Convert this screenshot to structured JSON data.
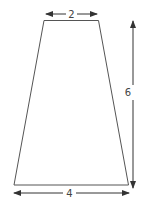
{
  "diagram": {
    "shape": "trapezoid",
    "colors": {
      "background": "#ffffff",
      "shape_stroke": "#555555",
      "arrow": "#333333",
      "label": "#444444"
    },
    "dimensions": {
      "top_width": {
        "label": "2"
      },
      "height": {
        "label": "6"
      },
      "bottom_width": {
        "label": "4"
      }
    }
  }
}
